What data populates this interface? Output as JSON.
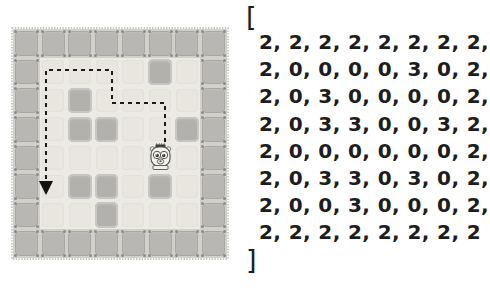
{
  "scene": {
    "title": "grid-world-with-matrix",
    "legend": {
      "wall_value": 2,
      "floor_value": 0,
      "block_value": 3
    }
  },
  "colors": {
    "floor": "#eceae4",
    "floor_inner": "#e8e6df",
    "wall": "#b9b7b3",
    "wall_bg": "#d2d0cb",
    "block": "#b3b1ad",
    "block_edge": "#c8c6c2",
    "path": "#1a1a1a",
    "text": "#1d1d1d",
    "background": "#ffffff",
    "bot_body": "#f2f0ec",
    "bot_outline": "#5a5754"
  },
  "grid": {
    "rows": 8,
    "cols": 8,
    "cells": [
      [
        2,
        2,
        2,
        2,
        2,
        2,
        2,
        2
      ],
      [
        2,
        0,
        0,
        0,
        0,
        3,
        0,
        2
      ],
      [
        2,
        0,
        3,
        0,
        0,
        0,
        0,
        2
      ],
      [
        2,
        0,
        3,
        3,
        0,
        0,
        3,
        2
      ],
      [
        2,
        0,
        0,
        0,
        0,
        0,
        0,
        2
      ],
      [
        2,
        0,
        3,
        3,
        0,
        3,
        0,
        2
      ],
      [
        2,
        0,
        0,
        3,
        0,
        0,
        0,
        2
      ],
      [
        2,
        2,
        2,
        2,
        2,
        2,
        2,
        2
      ]
    ]
  },
  "bot": {
    "name": "robot-character",
    "row": 4,
    "col": 5
  },
  "path": {
    "name": "dashed-path-arrow",
    "style": "dashed",
    "has_arrowhead": true,
    "arrowhead_direction": "down",
    "points": [
      [
        165,
        142
      ],
      [
        165,
        103
      ],
      [
        112,
        103
      ],
      [
        112,
        70
      ],
      [
        46,
        70
      ],
      [
        46,
        188
      ]
    ]
  },
  "matrix": {
    "open_bracket": "[",
    "close_bracket": "]",
    "rows": [
      "2, 2, 2, 2, 2, 2, 2, 2,",
      "2, 0, 0, 0, 0, 3, 0, 2,",
      "2, 0, 3, 0, 0, 0, 0, 2,",
      "2, 0, 3, 3, 0, 0, 3, 2,",
      "2, 0, 0, 0, 0, 0, 0, 2,",
      "2, 0, 3, 3, 0, 3, 0, 2,",
      "2, 0, 0, 3, 0, 0, 0, 2,",
      "2, 2, 2, 2, 2, 2, 2, 2"
    ]
  }
}
